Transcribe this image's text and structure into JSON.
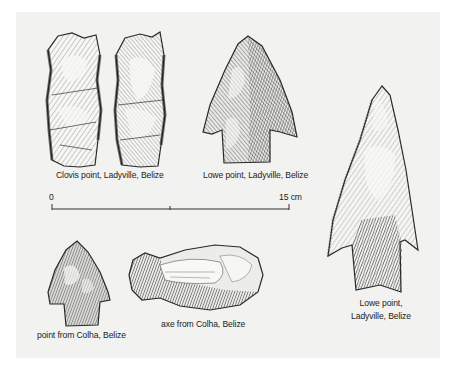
{
  "figure": {
    "background": "#f2f2f1",
    "ink_color": "#2a2a2a",
    "artifacts": [
      {
        "id": "clovis-1",
        "type": "Clovis point",
        "view": "face A"
      },
      {
        "id": "clovis-2",
        "type": "Clovis point",
        "view": "face B"
      },
      {
        "id": "lowe-small",
        "type": "Lowe point"
      },
      {
        "id": "lowe-large",
        "type": "Lowe point"
      },
      {
        "id": "colha-point",
        "type": "point"
      },
      {
        "id": "colha-axe",
        "type": "axe"
      }
    ],
    "labels": {
      "clovis": "Clovis point, Ladyville, Belize",
      "lowe_top": "Lowe point, Ladyville, Belize",
      "lowe_right_line1": "Lowe point,",
      "lowe_right_line2": "Ladyville, Belize",
      "colha_point": "point from Colha, Belize",
      "colha_axe": "axe from Colha, Belize"
    },
    "scale_bar": {
      "start_label": "0",
      "end_label": "15 cm",
      "length_cm": 15,
      "midpoint_tick": true
    }
  }
}
